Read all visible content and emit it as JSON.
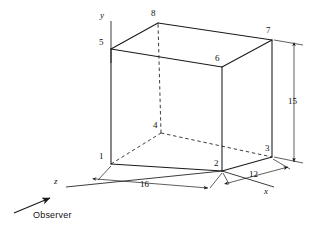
{
  "figure": {
    "kind": "engineering-drawing",
    "stroke_color": "#1a1a1a",
    "background_color": "#ffffff",
    "axes": [
      {
        "name": "y-axis",
        "label": "y"
      },
      {
        "name": "x-axis",
        "label": "x"
      },
      {
        "name": "z-axis",
        "label": "z"
      }
    ],
    "vertices": [
      {
        "id": "1",
        "label": "1",
        "x": 111,
        "y": 164,
        "hidden": false,
        "label_x": 99,
        "label_y": 156
      },
      {
        "id": "2",
        "label": "2",
        "x": 222,
        "y": 171,
        "hidden": false,
        "label_x": 214,
        "label_y": 163
      },
      {
        "id": "3",
        "label": "3",
        "x": 272,
        "y": 157,
        "hidden": false,
        "label_x": 265,
        "label_y": 148
      },
      {
        "id": "4",
        "label": "4",
        "x": 161,
        "y": 133,
        "hidden": true,
        "label_x": 153,
        "label_y": 124
      },
      {
        "id": "5",
        "label": "5",
        "x": 111,
        "y": 49,
        "hidden": false,
        "label_x": 99,
        "label_y": 42
      },
      {
        "id": "6",
        "label": "6",
        "x": 222,
        "y": 67,
        "hidden": false,
        "label_x": 215,
        "label_y": 57
      },
      {
        "id": "7",
        "label": "7",
        "x": 272,
        "y": 40,
        "hidden": false,
        "label_x": 266,
        "label_y": 29
      },
      {
        "id": "8",
        "label": "8",
        "x": 158,
        "y": 23,
        "hidden": false,
        "label_x": 151,
        "label_y": 12
      }
    ],
    "dimensions": [
      {
        "name": "width",
        "value": "16",
        "label_x": 142,
        "label_y": 186
      },
      {
        "name": "depth",
        "value": "12",
        "label_x": 250,
        "label_y": 174
      },
      {
        "name": "height",
        "value": "15",
        "label_x": 289,
        "label_y": 101
      }
    ],
    "annotations": [
      {
        "name": "observer",
        "text": "Observer",
        "label_x": 33,
        "label_y": 215
      }
    ],
    "axis_labels": [
      {
        "name": "y-axis-label",
        "text": "y",
        "label_x": 100,
        "label_y": 16
      },
      {
        "name": "x-axis-label",
        "text": "x",
        "label_x": 264,
        "label_y": 192
      },
      {
        "name": "z-axis-label",
        "text": "z",
        "label_x": 54,
        "label_y": 178
      }
    ]
  }
}
